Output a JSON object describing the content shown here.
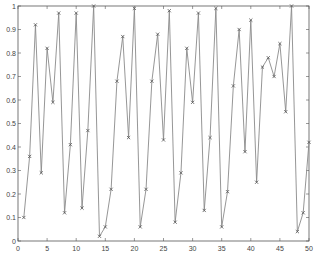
{
  "chart_data": {
    "type": "line",
    "title": "",
    "xlabel": "",
    "ylabel": "",
    "xlim": [
      0,
      50
    ],
    "ylim": [
      0,
      1
    ],
    "grid": false,
    "marker": "x",
    "line_color": "#8a8a8a",
    "marker_color": "#555555",
    "xticks": [
      0,
      5,
      10,
      15,
      20,
      25,
      30,
      35,
      40,
      45,
      50
    ],
    "xtick_labels": [
      "0",
      "5",
      "10",
      "15",
      "20",
      "25",
      "30",
      "35",
      "40",
      "45",
      "50"
    ],
    "yticks": [
      0,
      0.1,
      0.2,
      0.3,
      0.4,
      0.5,
      0.6,
      0.7,
      0.8,
      0.9,
      1
    ],
    "ytick_labels": [
      "0",
      "0.1",
      "0.2",
      "0.3",
      "0.4",
      "0.5",
      "0.6",
      "0.7",
      "0.8",
      "0.9",
      "1"
    ],
    "x": [
      1,
      2,
      3,
      4,
      5,
      6,
      7,
      8,
      9,
      10,
      11,
      12,
      13,
      14,
      15,
      16,
      17,
      18,
      19,
      20,
      21,
      22,
      23,
      24,
      25,
      26,
      27,
      28,
      29,
      30,
      31,
      32,
      33,
      34,
      35,
      36,
      37,
      38,
      39,
      40,
      41,
      42,
      43,
      44,
      45,
      46,
      47,
      48,
      49,
      50
    ],
    "series": [
      {
        "name": "series-1",
        "values": [
          0.1,
          0.36,
          0.92,
          0.29,
          0.82,
          0.59,
          0.97,
          0.12,
          0.41,
          0.97,
          0.14,
          0.47,
          1.0,
          0.02,
          0.06,
          0.22,
          0.68,
          0.87,
          0.44,
          0.99,
          0.06,
          0.22,
          0.68,
          0.88,
          0.43,
          0.98,
          0.08,
          0.29,
          0.82,
          0.59,
          0.97,
          0.13,
          0.44,
          0.99,
          0.06,
          0.21,
          0.66,
          0.9,
          0.38,
          0.94,
          0.25,
          0.74,
          0.78,
          0.7,
          0.84,
          0.55,
          1.0,
          0.04,
          0.12,
          0.42
        ]
      }
    ]
  }
}
